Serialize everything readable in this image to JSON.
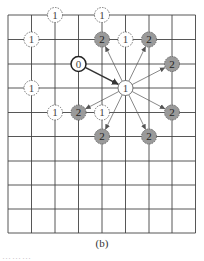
{
  "grid": {
    "x": [
      8,
      31.5,
      55,
      78.5,
      102,
      125.5,
      149,
      172,
      195.5
    ],
    "y": [
      15,
      39.5,
      64,
      88,
      112.5,
      136.5,
      161,
      185,
      209,
      233
    ],
    "line_color": "#444444"
  },
  "nodes": [
    {
      "id": "n1a",
      "label": "1",
      "x": 55,
      "y": 15,
      "style": "dashed"
    },
    {
      "id": "n1b",
      "label": "1",
      "x": 102,
      "y": 15,
      "style": "dashed"
    },
    {
      "id": "n1c",
      "label": "1",
      "x": 31.5,
      "y": 39.5,
      "style": "dashed"
    },
    {
      "id": "n2a",
      "label": "2",
      "x": 102,
      "y": 39.5,
      "style": "gray"
    },
    {
      "id": "n1d",
      "label": "1",
      "x": 125.5,
      "y": 39.5,
      "style": "dashed"
    },
    {
      "id": "n2b",
      "label": "2",
      "x": 149,
      "y": 39.5,
      "style": "gray"
    },
    {
      "id": "n0",
      "label": "0",
      "x": 78.5,
      "y": 64,
      "style": "bold"
    },
    {
      "id": "n2c",
      "label": "2",
      "x": 172,
      "y": 64,
      "style": "gray"
    },
    {
      "id": "n1e",
      "label": "1",
      "x": 31.5,
      "y": 88,
      "style": "dashed"
    },
    {
      "id": "n1m",
      "label": "1",
      "x": 125.5,
      "y": 88,
      "style": "solid"
    },
    {
      "id": "n1f",
      "label": "1",
      "x": 55,
      "y": 112.5,
      "style": "dashed"
    },
    {
      "id": "n2d",
      "label": "2",
      "x": 78.5,
      "y": 112.5,
      "style": "gray"
    },
    {
      "id": "n1g",
      "label": "1",
      "x": 102,
      "y": 112.5,
      "style": "dashed"
    },
    {
      "id": "n2e",
      "label": "2",
      "x": 172,
      "y": 112.5,
      "style": "gray"
    },
    {
      "id": "n2f",
      "label": "2",
      "x": 102,
      "y": 136.5,
      "style": "gray"
    },
    {
      "id": "n2g",
      "label": "2",
      "x": 149,
      "y": 136.5,
      "style": "gray"
    }
  ],
  "edges": [
    {
      "from": "n0",
      "to": "n1m",
      "weight": "bold"
    },
    {
      "from": "n1m",
      "to": "n2a",
      "weight": "thin"
    },
    {
      "from": "n1m",
      "to": "n2b",
      "weight": "thin"
    },
    {
      "from": "n1m",
      "to": "n2c",
      "weight": "thin"
    },
    {
      "from": "n1m",
      "to": "n2d",
      "weight": "thin"
    },
    {
      "from": "n1m",
      "to": "n2e",
      "weight": "thin"
    },
    {
      "from": "n1m",
      "to": "n2f",
      "weight": "thin"
    },
    {
      "from": "n1m",
      "to": "n2g",
      "weight": "thin"
    }
  ],
  "colors": {
    "gray_fill": "#9a9a9a",
    "node_stroke": "#555555",
    "arrow": "#555555"
  },
  "caption": "(b)",
  "cut_text": "………"
}
